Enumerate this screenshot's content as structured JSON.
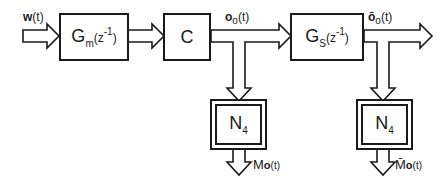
{
  "diagram": {
    "type": "block-diagram",
    "blocks": [
      {
        "id": "gm",
        "name": "G",
        "sub": "m",
        "arg": "(z",
        "exp": "-1",
        "close": ")"
      },
      {
        "id": "c",
        "label": "C"
      },
      {
        "id": "gs",
        "name": "G",
        "sub": "S",
        "arg": "(z",
        "exp": "-1",
        "close": ")"
      },
      {
        "id": "n4a",
        "name": "N",
        "sub": "4"
      },
      {
        "id": "n4b",
        "name": "N",
        "sub": "4"
      }
    ],
    "signals": {
      "input": {
        "name": "w",
        "arg": "(t)"
      },
      "o": {
        "name": "o",
        "sub": "o",
        "arg": "(t)"
      },
      "obar": {
        "name": "ō",
        "sub": "o",
        "arg": "(t)"
      },
      "M": {
        "name": "M",
        "sub": "o",
        "arg": "(t)"
      },
      "Mbar": {
        "name": "M̄",
        "sub": "o",
        "arg": "(t)"
      }
    },
    "connections": [
      {
        "from": "w(t)",
        "to": "gm"
      },
      {
        "from": "gm",
        "to": "c"
      },
      {
        "from": "c",
        "to": "gs",
        "signal": "o_o(t)"
      },
      {
        "from": "o_o(t)",
        "to": "n4a"
      },
      {
        "from": "n4a",
        "to": "M_o(t)"
      },
      {
        "from": "gs",
        "to": "output",
        "signal": "ō_o(t)"
      },
      {
        "from": "ō_o(t)",
        "to": "n4b"
      },
      {
        "from": "n4b",
        "to": "M̄_o(t)"
      }
    ]
  }
}
